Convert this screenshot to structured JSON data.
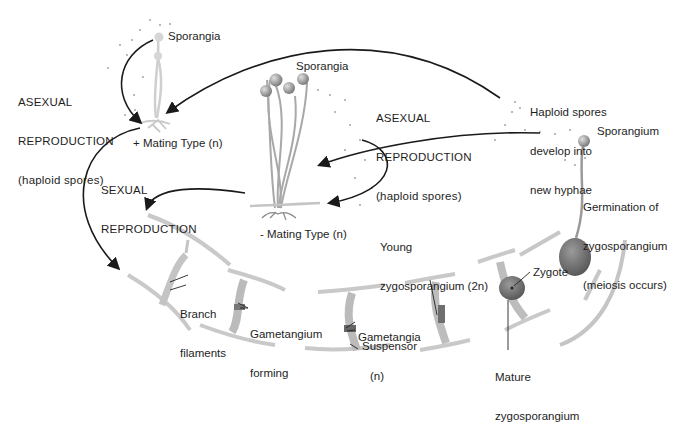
{
  "diagram": {
    "type": "life-cycle",
    "colors": {
      "arrow": "#1a1a1a",
      "hypha": "#b9b9b9",
      "sporangium": "#8a8a8a",
      "zygosporangium": "#6a6a6a",
      "text": "#1e1e1e"
    },
    "labels": {
      "sporangia_top": "Sporangia",
      "asexual_left": [
        "ASEXUAL",
        "REPRODUCTION",
        "(haploid spores)"
      ],
      "plus_mating": "+ Mating Type (n)",
      "sexual": [
        "SEXUAL",
        "REPRODUCTION"
      ],
      "sporangia_middle": "Sporangia",
      "asexual_middle": [
        "ASEXUAL",
        "REPRODUCTION",
        "(haploid spores)"
      ],
      "minus_mating": "- Mating Type (n)",
      "haploid_spores": [
        "Haploid spores",
        "develop into",
        "new hyphae"
      ],
      "sporangium": "Sporangium",
      "germination": [
        "Germination of",
        "zygosporangium",
        "(meiosis occurs)"
      ],
      "young_zygo": [
        "Young",
        "zygosporangium (2n)"
      ],
      "zygote": "Zygote",
      "mature_zygo": [
        "Mature",
        "zygosporangium"
      ],
      "branch_filaments": [
        "Branch",
        "filaments"
      ],
      "gametangium_forming": [
        "Gametangium",
        "forming"
      ],
      "gametangia": [
        "Gametangia",
        "(n)"
      ],
      "suspensor": "Suspensor"
    },
    "stages": [
      "+ Mating Type (n)",
      "- Mating Type (n)",
      "Branch filaments",
      "Gametangium forming",
      "Gametangia (n) / Suspensor",
      "Young zygosporangium (2n)",
      "Mature zygosporangium / Zygote",
      "Germination of zygosporangium (meiosis occurs)",
      "Sporangium",
      "Haploid spores develop into new hyphae"
    ]
  }
}
